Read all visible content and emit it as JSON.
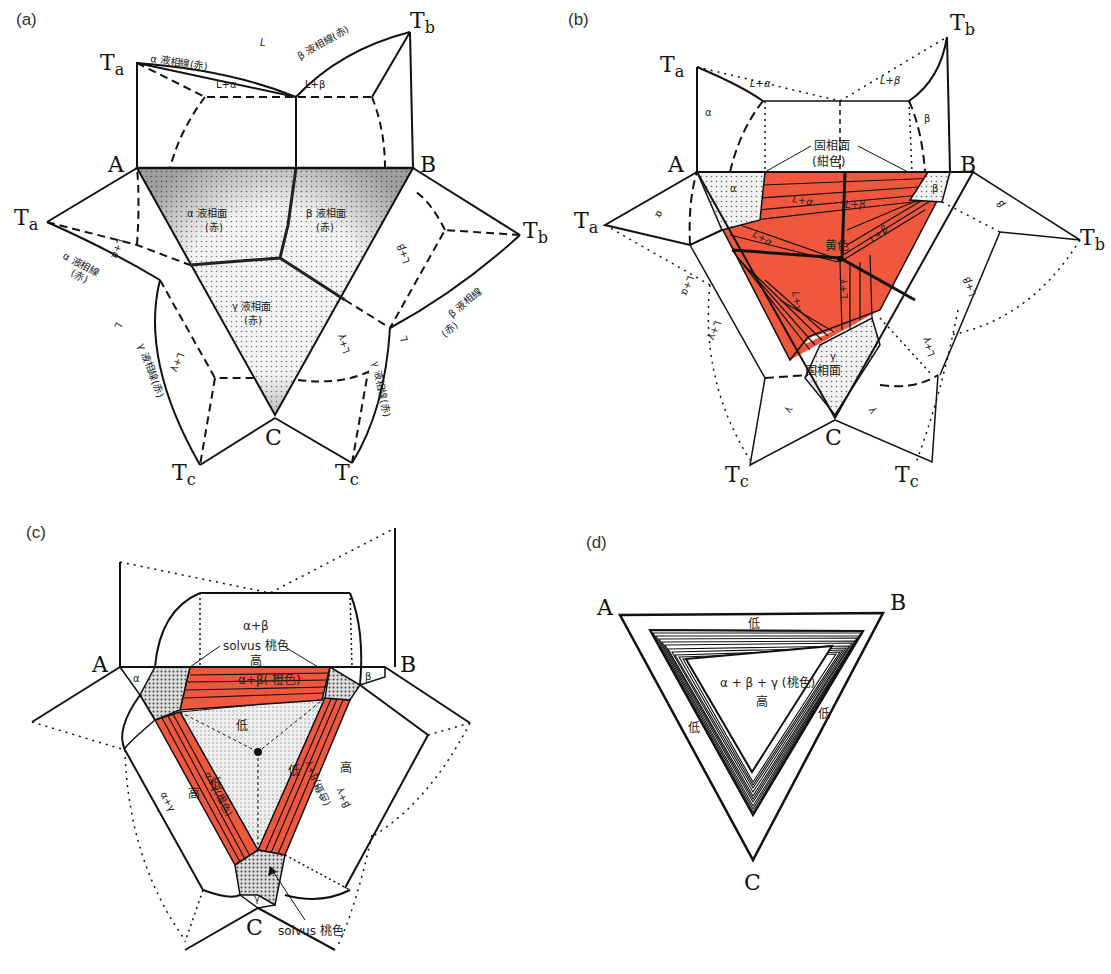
{
  "colors": {
    "red_fill": "#f0573d",
    "stipple": "#8a8a8a",
    "line": "#111111",
    "background": "#ffffff"
  },
  "panels": {
    "a": {
      "label": "(a)",
      "vertices": {
        "A": "A",
        "B": "B",
        "C": "C",
        "Ta": "Ta",
        "Tb": "Tb",
        "Tc": "Tc"
      },
      "texts": {
        "L": "L",
        "alpha_liquidus_line_top": "α 液相線(赤)",
        "beta_liquidus_line_top": "β 液相線(赤)",
        "L_alpha": "L+α",
        "L_beta": "L+β",
        "alpha_liquidus_surface": "α 液相面",
        "alpha_surface_red": "(赤)",
        "beta_liquidus_surface": "β 液相面",
        "beta_surface_red": "(赤)",
        "gamma_liquidus_surface": "γ 液相面",
        "gamma_surface_red": "(赤)",
        "alpha_liquidus_line_left": "α 液相線",
        "alpha_line_left_red": "(赤)",
        "beta_liquidus_line_right": "β 液相線",
        "beta_line_right_red": "(赤)",
        "gamma_liquidus_line_left": "γ 液相線(赤)",
        "gamma_liquidus_line_right": "γ 液相線(赤)",
        "L_alpha_left": "L+α",
        "L_gamma_left": "L+γ",
        "L_beta_right": "L+β",
        "L_gamma_right": "L+γ",
        "L_left": "L",
        "L_right": "L"
      }
    },
    "b": {
      "label": "(b)",
      "vertices": {
        "A": "A",
        "B": "B",
        "C": "C",
        "Ta": "Ta",
        "Tb": "Tb",
        "Tc": "Tc"
      },
      "texts": {
        "L_alpha_top": "L+α",
        "L_beta_top": "L+β",
        "alpha_top": "α",
        "beta_top": "β",
        "solidus": "固相面",
        "solidus_color": "(紺色)",
        "alpha_region": "α",
        "beta_region": "β",
        "L_alpha_1": "L+α",
        "L_beta_1": "L+β",
        "L_alpha_2": "L+α",
        "L_beta_2": "L+β",
        "yellow": "黄色",
        "L_gamma_1": "L+γ",
        "L_gamma_2": "L+γ",
        "gamma_region": "γ",
        "gamma_solidus": "固相面",
        "alpha_left": "α",
        "beta_right": "β",
        "L_alpha_left": "L+α",
        "L_gamma_left": "L+γ",
        "L_beta_right": "L+β",
        "L_gamma_right": "L+γ",
        "gamma_left": "γ",
        "gamma_right": "γ"
      }
    },
    "c": {
      "label": "(c)",
      "vertices": {
        "A": "A",
        "B": "B",
        "C": "C"
      },
      "texts": {
        "alpha_beta_top": "α+β",
        "solvus_top": "solvus 桃色",
        "high_top": "高",
        "alpha_beta_orange": "α+β( 橙色)",
        "alpha": "α",
        "beta": "β",
        "low_center_top": "低",
        "low_center_left": "低",
        "low_center_right": "低",
        "alpha_gamma_orange": "α+γ(橙色)",
        "high_left": "高",
        "beta_gamma_orange": "γ+β(橙色)",
        "high_right": "高",
        "alpha_gamma": "α+γ",
        "beta_gamma": "β+γ",
        "gamma": "γ",
        "solvus_bottom": "solvus 桃色"
      }
    },
    "d": {
      "label": "(d)",
      "vertices": {
        "A": "A",
        "B": "B",
        "C": "C"
      },
      "texts": {
        "low_top": "低",
        "center": "α + β + γ (桃色)",
        "high": "高",
        "low_left": "低",
        "low_right": "低"
      }
    }
  }
}
